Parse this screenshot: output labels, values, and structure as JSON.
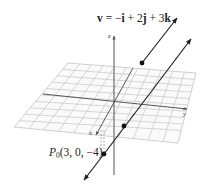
{
  "diagram": {
    "vector_label": {
      "v": "v",
      "eq": " = −",
      "i": "i",
      "plus1": " + 2",
      "j": "j",
      "plus2": " + 3",
      "k": "k"
    },
    "point_label": {
      "name": "P",
      "subscript": "0",
      "coords": "(3, 0, −4)"
    },
    "axes": {
      "x": "x",
      "y": "y",
      "z": "z"
    },
    "colors": {
      "grid": "#bdbdbd",
      "axis": "#555555",
      "line": "#222222",
      "text": "#222222"
    }
  }
}
